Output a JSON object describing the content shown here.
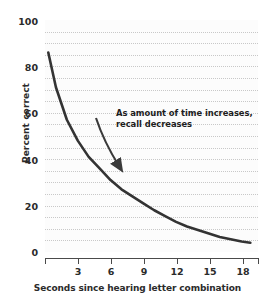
{
  "chart_data": {
    "type": "line",
    "title": "",
    "xlabel": "Seconds since hearing letter combination",
    "ylabel": "Percent correct",
    "xlim": [
      0,
      19.5
    ],
    "ylim": [
      0,
      100
    ],
    "x_ticks": [
      3,
      6,
      9,
      12,
      15,
      18
    ],
    "x_tick_labels": [
      "3",
      "6",
      "9",
      "12",
      "15",
      "18"
    ],
    "y_ticks": [
      0,
      20,
      40,
      60,
      80,
      100
    ],
    "y_tick_labels": [
      "0",
      "20",
      "40",
      "60",
      "80",
      "100"
    ],
    "grid": "horizontal dotted every 5 units",
    "grid_step": 5,
    "legend": null,
    "series": [
      {
        "name": "Recall accuracy",
        "x": [
          0.3,
          1,
          2,
          3,
          4,
          5,
          6,
          7,
          8,
          9,
          10,
          11,
          12,
          13,
          14,
          15,
          16,
          17,
          18,
          18.8
        ],
        "y": [
          86,
          71,
          57,
          48,
          41,
          36,
          31,
          27,
          24,
          21,
          18,
          15.5,
          13,
          11,
          9.5,
          8,
          6.5,
          5.5,
          4.5,
          4
        ]
      }
    ],
    "annotations": [
      {
        "name": "trend-callout",
        "line1": "As amount of time increases,",
        "line2": "recall decreases",
        "arrow": {
          "from": [
            96,
            118
          ],
          "to": [
            122,
            172
          ]
        }
      }
    ],
    "colors": {
      "curve": "#333333",
      "grid": "#c8c8c8",
      "axis": "#4a4a4a",
      "text": "#2b2b2b",
      "plot_background": "#fcfcfc"
    }
  }
}
